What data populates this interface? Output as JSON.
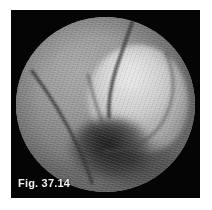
{
  "figure": {
    "caption": "Fig. 37.14",
    "caption_position": "bottom-left",
    "media_type": "arthroscopic-photograph",
    "view_shape": "circular",
    "color_mode": "grayscale"
  },
  "frame": {
    "background_color": "#050505",
    "page_background_color": "#ffffff"
  },
  "scope_view": {
    "rim_color": "#050505",
    "tissue_mid_tone": "#8a8a8a",
    "highlight_tone": "#d2d2d2",
    "shadow_tone": "#1e1e1e",
    "texture": "horizontal-scanlines"
  },
  "anatomy": [
    {
      "name": "condyle-highlight",
      "label": "bright convex articular surface",
      "tone": "#d2d2d2"
    },
    {
      "name": "intercondylar-shadow",
      "label": "dark recess below the convex surface",
      "tone": "#1e1e1e"
    },
    {
      "name": "fibrous-band-upper",
      "label": "dark band descending from upper field",
      "tone": "#3c3c3c"
    },
    {
      "name": "fibrous-band-left",
      "label": "dark band sweeping to lower left",
      "tone": "#3c3c3c"
    }
  ]
}
